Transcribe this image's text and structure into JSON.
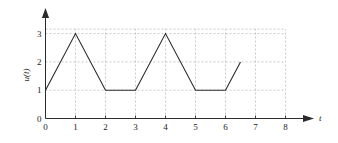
{
  "chart_data": {
    "type": "line",
    "title": "",
    "subtitle": "",
    "xlabel": "t",
    "ylabel": "u(t)",
    "xlim": [
      0,
      8
    ],
    "ylim": [
      0,
      3.35
    ],
    "xticks": [
      0,
      1,
      2,
      3,
      4,
      5,
      6,
      7,
      8
    ],
    "xtick_labels": [
      "0",
      "1",
      "2",
      "3",
      "4",
      "5",
      "6",
      "7",
      "8"
    ],
    "yticks": [
      0,
      1,
      2,
      3
    ],
    "ytick_labels": [
      "0",
      "1",
      "2",
      "3"
    ],
    "grid": true,
    "grid_style": "dashed",
    "grid_color": "#b4b4b4",
    "legend": null,
    "series": [
      {
        "name": "u(t)",
        "color": "#2b2b2b",
        "line_width": 1.1,
        "points": [
          {
            "t": 0,
            "u": 1
          },
          {
            "t": 1,
            "u": 3
          },
          {
            "t": 2,
            "u": 1
          },
          {
            "t": 3,
            "u": 1
          },
          {
            "t": 4,
            "u": 3
          },
          {
            "t": 5,
            "u": 1
          },
          {
            "t": 6,
            "u": 1
          },
          {
            "t": 6.5,
            "u": 2
          }
        ]
      }
    ],
    "annotations": [],
    "axis_arrows": {
      "x": "right",
      "y": "up"
    },
    "axis_color": "#2b2b2b",
    "background": "#ffffff"
  },
  "labels": {
    "x_axis_name": "t",
    "y_axis_name": "u(t)"
  }
}
